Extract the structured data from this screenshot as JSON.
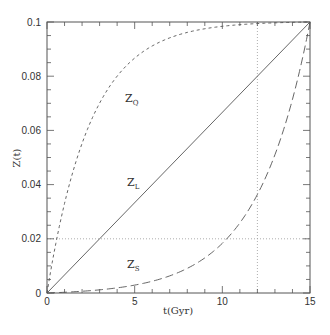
{
  "chart_data": {
    "type": "line",
    "title": "",
    "xlabel": "t(Gyr)",
    "ylabel": "Z(t)",
    "xlim": [
      0,
      15
    ],
    "ylim": [
      0,
      0.1
    ],
    "x_ticks": [
      "0",
      "5",
      "10",
      "15"
    ],
    "y_ticks": [
      "0",
      "0.02",
      "0.04",
      "0.06",
      "0.08",
      "0.1"
    ],
    "grid": false,
    "legend": "inline labels",
    "series": [
      {
        "name": "Z_Q",
        "label_main": "Z",
        "label_sub": "Q",
        "style": "short-dashed",
        "x": [
          0,
          0.5,
          1,
          1.5,
          2,
          3,
          4,
          5,
          6,
          7,
          8,
          9,
          10,
          11,
          12,
          13,
          14,
          15
        ],
        "values": [
          0,
          0.0182,
          0.033,
          0.0452,
          0.0551,
          0.0699,
          0.0798,
          0.0865,
          0.091,
          0.094,
          0.096,
          0.0973,
          0.0982,
          0.0988,
          0.0992,
          0.0995,
          0.0997,
          0.1
        ]
      },
      {
        "name": "Z_L",
        "label_main": "Z",
        "label_sub": "L",
        "style": "solid",
        "x": [
          0,
          15
        ],
        "values": [
          0,
          0.1
        ]
      },
      {
        "name": "Z_S",
        "label_main": "Z",
        "label_sub": "S",
        "style": "long-dashed",
        "x": [
          0,
          1,
          2,
          3,
          4,
          5,
          6,
          7,
          8,
          9,
          10,
          11,
          12,
          13,
          14,
          15
        ],
        "values": [
          0,
          0.0003,
          0.0006,
          0.0012,
          0.0019,
          0.0029,
          0.0043,
          0.0062,
          0.0088,
          0.0124,
          0.0172,
          0.0238,
          0.0328,
          0.045,
          0.0617,
          0.1
        ]
      }
    ],
    "reference_lines": [
      {
        "orientation": "horizontal",
        "value": 0.02,
        "style": "dotted"
      },
      {
        "orientation": "vertical",
        "value": 12,
        "style": "dotted"
      }
    ]
  }
}
